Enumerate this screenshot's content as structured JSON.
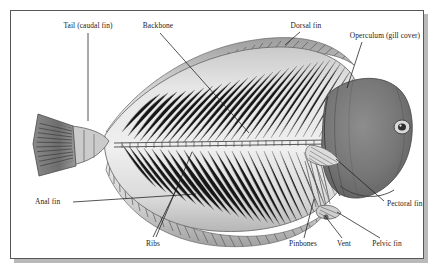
{
  "figure": {
    "style": "grayscale scientific illustration",
    "frame": {
      "border_color": "#575757",
      "shadow_color": "#b9b9b9",
      "background": "#ffffff"
    },
    "palette": {
      "ink": "#1b1b1b",
      "body_light": "#e8e8e8",
      "body_mid": "#bfbfbf",
      "body_dark": "#8f8f8f",
      "head_dark": "#6f6f6f",
      "fin_shadow": "#9a9a9a",
      "leader_line": "#1b1b1b"
    }
  },
  "labels": [
    {
      "id": "tail",
      "text": "Tail (caudal fin)",
      "align": "center",
      "text_x": 88,
      "text_y": 22,
      "leader": [
        [
          88,
          33
        ],
        [
          88,
          121
        ]
      ]
    },
    {
      "id": "backbone",
      "text": "Backbone",
      "align": "center",
      "text_x": 158,
      "text_y": 22,
      "leader": [
        [
          160,
          33
        ],
        [
          249,
          133
        ]
      ]
    },
    {
      "id": "dorsal-fin",
      "text": "Dorsal fin",
      "align": "center",
      "text_x": 306,
      "text_y": 22,
      "leader": [
        [
          300,
          32
        ],
        [
          285,
          45
        ]
      ]
    },
    {
      "id": "operculum",
      "text": "Operculum (gill cover)",
      "align": "center",
      "text_x": 385,
      "text_y": 32,
      "leader": [
        [
          362,
          42
        ],
        [
          347,
          88
        ]
      ]
    },
    {
      "id": "pectoral-fin",
      "text": "Pectoral fin",
      "align": "left",
      "text_x": 387,
      "text_y": 200,
      "leader": [
        [
          384,
          201
        ],
        [
          336,
          159
        ]
      ]
    },
    {
      "id": "pelvic-fin",
      "text": "Pelvic fin",
      "align": "center",
      "text_x": 387,
      "text_y": 240,
      "leader": [
        [
          380,
          238
        ],
        [
          337,
          212
        ]
      ]
    },
    {
      "id": "vent",
      "text": "Vent",
      "align": "center",
      "text_x": 344,
      "text_y": 240,
      "leader": [
        [
          342,
          238
        ],
        [
          325,
          216
        ]
      ]
    },
    {
      "id": "pinbones",
      "text": "Pinbones",
      "align": "center",
      "text_x": 303,
      "text_y": 240,
      "leader": [
        [
          304,
          238
        ],
        [
          314,
          199
        ]
      ]
    },
    {
      "id": "ribs",
      "text": "Ribs",
      "align": "center",
      "text_x": 153,
      "text_y": 240,
      "leader_multi": [
        [
          [
            153,
            237
          ],
          [
            178,
            186
          ]
        ],
        [
          [
            156,
            237
          ],
          [
            192,
            152
          ]
        ]
      ]
    },
    {
      "id": "anal-fin",
      "text": "Anal fin",
      "align": "left",
      "text_x": 35,
      "text_y": 198,
      "leader": [
        [
          73,
          202
        ],
        [
          196,
          194
        ]
      ]
    }
  ],
  "anatomy_parts": [
    "Tail (caudal fin)",
    "Backbone",
    "Dorsal fin",
    "Operculum (gill cover)",
    "Pectoral fin",
    "Pelvic fin",
    "Vent",
    "Pinbones",
    "Ribs",
    "Anal fin"
  ]
}
